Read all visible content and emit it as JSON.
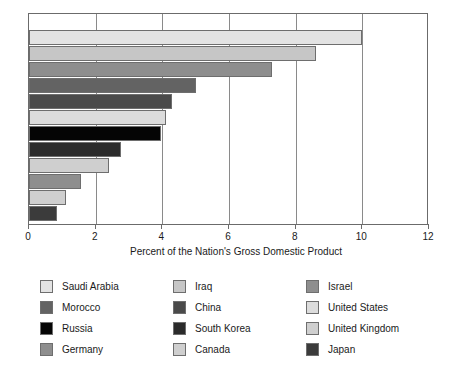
{
  "chart_data": {
    "type": "bar",
    "orientation": "horizontal",
    "title": "",
    "xlabel": "Percent of the Nation's Gross Domestic Product",
    "ylabel": "",
    "xlim": [
      0,
      12
    ],
    "xticks": [
      0,
      2,
      4,
      6,
      8,
      10,
      12
    ],
    "xtick_labels": [
      "0",
      "2",
      "4",
      "6",
      "8",
      "10",
      "12"
    ],
    "grid": "vertical",
    "legend_position": "below",
    "categories": [
      "Saudi Arabia",
      "Iraq",
      "Israel",
      "Morocco",
      "China",
      "United States",
      "Russia",
      "South Korea",
      "Germany",
      "Canada",
      "United Kingdom",
      "Japan"
    ],
    "values": [
      10.0,
      8.6,
      7.3,
      5.0,
      4.3,
      4.1,
      3.95,
      2.75,
      1.55,
      2.4,
      1.1,
      0.85
    ],
    "bars": [
      {
        "label": "Saudi Arabia",
        "value": 10.0,
        "color": "#e3e3e3"
      },
      {
        "label": "Iraq",
        "value": 8.6,
        "color": "#c6c6c6"
      },
      {
        "label": "Israel",
        "value": 7.3,
        "color": "#8e8e8e"
      },
      {
        "label": "Morocco",
        "value": 5.0,
        "color": "#636363"
      },
      {
        "label": "China",
        "value": 4.3,
        "color": "#4a4a4a"
      },
      {
        "label": "United States",
        "value": 4.1,
        "color": "#dcdcdc"
      },
      {
        "label": "Russia",
        "value": 3.95,
        "color": "#050505"
      },
      {
        "label": "South Korea",
        "value": 2.75,
        "color": "#2b2b2b"
      },
      {
        "label": "Canada",
        "value": 2.4,
        "color": "#cfcfcf"
      },
      {
        "label": "Germany",
        "value": 1.55,
        "color": "#8e8e8e"
      },
      {
        "label": "United Kingdom",
        "value": 1.1,
        "color": "#cfcfcf"
      },
      {
        "label": "Japan",
        "value": 0.85,
        "color": "#3b3b3b"
      }
    ]
  },
  "axis": {
    "x_title": "Percent of the Nation's Gross Domestic Product",
    "tick_0": "0",
    "tick_2": "2",
    "tick_4": "4",
    "tick_6": "6",
    "tick_8": "8",
    "tick_10": "10",
    "tick_12": "12"
  },
  "legend": {
    "columns": [
      {
        "items": [
          {
            "label": "Saudi Arabia",
            "color": "#e3e3e3"
          },
          {
            "label": "Morocco",
            "color": "#636363"
          },
          {
            "label": "Russia",
            "color": "#050505"
          },
          {
            "label": "Germany",
            "color": "#8e8e8e"
          }
        ]
      },
      {
        "items": [
          {
            "label": "Iraq",
            "color": "#c6c6c6"
          },
          {
            "label": "China",
            "color": "#4a4a4a"
          },
          {
            "label": "South Korea",
            "color": "#2b2b2b"
          },
          {
            "label": "Canada",
            "color": "#cfcfcf"
          }
        ]
      },
      {
        "items": [
          {
            "label": "Israel",
            "color": "#8e8e8e"
          },
          {
            "label": "United States",
            "color": "#dcdcdc"
          },
          {
            "label": "United Kingdom",
            "color": "#cfcfcf"
          },
          {
            "label": "Japan",
            "color": "#3b3b3b"
          }
        ]
      }
    ]
  }
}
